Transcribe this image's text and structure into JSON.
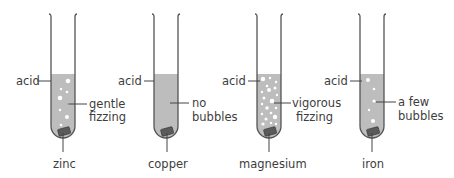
{
  "diagram": {
    "colors": {
      "acid": "#bdbdbd",
      "glass": "#555555",
      "metal": "#5a5a5a",
      "bubble": "#ffffff",
      "text": "#3d3d3d"
    },
    "tubes": [
      {
        "id": "zinc",
        "acid_label": "acid",
        "obs_line1": "gentle",
        "obs_line2": "fizzing",
        "metal": "zinc"
      },
      {
        "id": "copper",
        "acid_label": "acid",
        "obs_line1": "no",
        "obs_line2": "bubbles",
        "metal": "copper"
      },
      {
        "id": "magnesium",
        "acid_label": "acid",
        "obs_line1": "vigorous",
        "obs_line2": "fizzing",
        "metal": "magnesium"
      },
      {
        "id": "iron",
        "acid_label": "acid",
        "obs_line1": "a few",
        "obs_line2": "bubbles",
        "metal": "iron"
      }
    ]
  }
}
